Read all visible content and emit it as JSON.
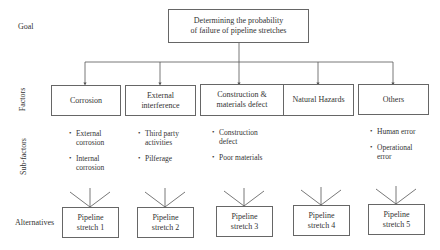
{
  "row_labels": {
    "goal": "Goal",
    "factors": "Factors",
    "sub_factors": "Sub-factors",
    "alternatives": "Alternatives"
  },
  "goal": {
    "line1": "Determining the probability",
    "line2": "of failure of pipeline stretches"
  },
  "factors": [
    {
      "line1": "Corrosion",
      "line2": ""
    },
    {
      "line1": "External",
      "line2": "interference"
    },
    {
      "line1": "Construction &",
      "line2": "materials defect"
    },
    {
      "line1": "Natural Hazards",
      "line2": ""
    },
    {
      "line1": "Others",
      "line2": ""
    }
  ],
  "sub_factors": [
    {
      "items": [
        {
          "line1": "External",
          "line2": "corrosion"
        },
        {
          "line1": "Internal",
          "line2": "corrosion"
        }
      ]
    },
    {
      "items": [
        {
          "line1": "Third party",
          "line2": "activities"
        },
        {
          "line1": "Pilferage",
          "line2": ""
        }
      ]
    },
    {
      "items": [
        {
          "line1": "Construction",
          "line2": "defect"
        },
        {
          "line1": "Poor materials",
          "line2": ""
        }
      ]
    },
    {
      "items": []
    },
    {
      "items": [
        {
          "line1": "Human error",
          "line2": ""
        },
        {
          "line1": "Operational",
          "line2": "error"
        }
      ]
    }
  ],
  "alternatives": [
    {
      "line1": "Pipeline",
      "line2": "stretch 1"
    },
    {
      "line1": "Pipeline",
      "line2": "stretch 2"
    },
    {
      "line1": "Pipeline",
      "line2": "stretch 3"
    },
    {
      "line1": "Pipeline",
      "line2": "stretch 4"
    },
    {
      "line1": "Pipeline",
      "line2": "stretch 5"
    }
  ],
  "bullet_glyph": "•",
  "colors": {
    "line": "#555555",
    "text": "#333333"
  }
}
